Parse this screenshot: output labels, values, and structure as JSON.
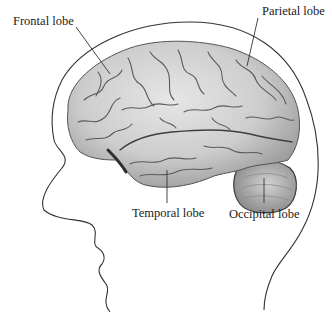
{
  "diagram": {
    "labels": {
      "frontal": "Frontal lobe",
      "parietal": "Parietal lobe",
      "temporal": "Temporal lobe",
      "occipital": "Occipital lobe"
    },
    "colors": {
      "background": "#ffffff",
      "outline": "#333333",
      "leader_line": "#333333",
      "brain_fill": "#cfcfcf",
      "brain_shadow": "#3a3a3a",
      "label_text": "#1a1a1a"
    }
  }
}
